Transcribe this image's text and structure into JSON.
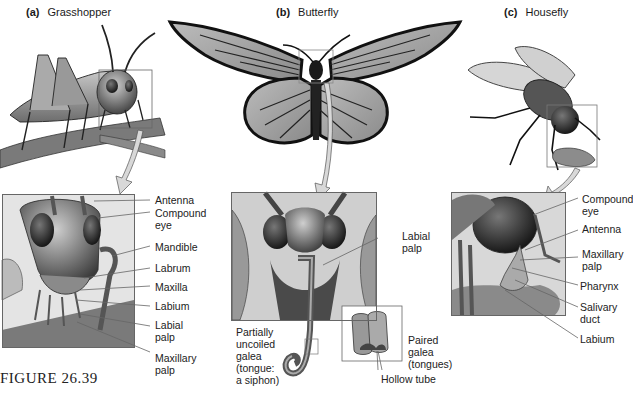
{
  "figure": {
    "caption": "FIGURE 26.39",
    "panels": [
      {
        "id": "a",
        "letter": "(a)",
        "title": "Grasshopper",
        "labels": [
          "Antenna",
          "Compound\neye",
          "Mandible",
          "Labrum",
          "Maxilla",
          "Labium",
          "Labial\npalp",
          "Maxillary\npalp"
        ]
      },
      {
        "id": "b",
        "letter": "(b)",
        "title": "Butterfly",
        "labels": [
          "Labial\npalp",
          "Partially\nuncoiled\ngalea\n(tongue:\na siphon)",
          "Paired\ngalea\n(tongues)",
          "Hollow tube"
        ]
      },
      {
        "id": "c",
        "letter": "(c)",
        "title": "Housefly",
        "labels": [
          "Compound\neye",
          "Antenna",
          "Maxillary\npalp",
          "Pharynx",
          "Salivary\nduct",
          "Labium"
        ]
      }
    ]
  },
  "colors": {
    "line": "#666666",
    "arrow_fill": "#d8d8d8",
    "insect_dark": "#2a2a2a",
    "insect_mid": "#7a7a7a",
    "insect_light": "#b5b5b5",
    "branch": "#6e6e6e",
    "fluid": "#8c8c8c"
  }
}
